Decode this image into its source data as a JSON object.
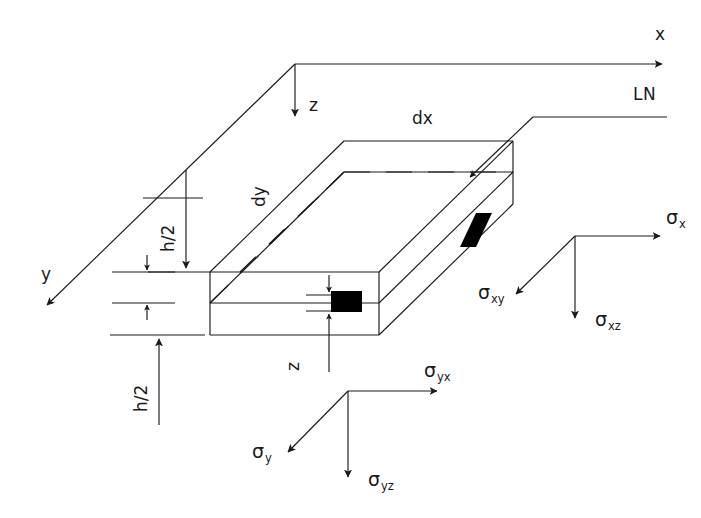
{
  "figure": {
    "type": "engineering-diagram",
    "background_color": "#ffffff",
    "line_color": "#1a1a1a",
    "fill_color": "#000000"
  },
  "axes": {
    "x_label": "x",
    "y_label": "y",
    "z_label": "z"
  },
  "annotations": {
    "neutral_line": "LN",
    "dx": "dx",
    "dy": "dy",
    "h_half_upper": "h/2",
    "h_half_lower": "h/2",
    "depth_z": "z"
  },
  "stresses": {
    "x_face": [
      {
        "name": "sigma-x",
        "symbol": "σ",
        "subscript": "x",
        "direction": "right"
      },
      {
        "name": "sigma-xy",
        "symbol": "σ",
        "subscript": "xy",
        "direction": "down-left"
      },
      {
        "name": "sigma-xz",
        "symbol": "σ",
        "subscript": "xz",
        "direction": "down"
      }
    ],
    "y_face": [
      {
        "name": "sigma-yx",
        "symbol": "σ",
        "subscript": "yx",
        "direction": "right"
      },
      {
        "name": "sigma-y",
        "symbol": "σ",
        "subscript": "y",
        "direction": "down-left"
      },
      {
        "name": "sigma-yz",
        "symbol": "σ",
        "subscript": "yz",
        "direction": "down"
      }
    ]
  }
}
